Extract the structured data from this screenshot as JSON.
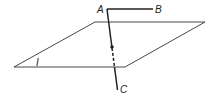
{
  "diagram": {
    "labels": {
      "point_a": "A",
      "point_b": "B",
      "point_c": "C",
      "plane": "I"
    },
    "colors": {
      "stroke": "#222222",
      "background": "#ffffff"
    }
  }
}
